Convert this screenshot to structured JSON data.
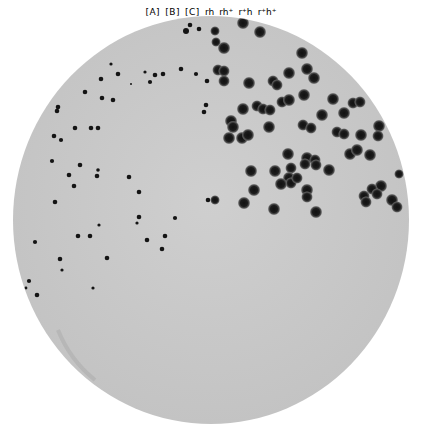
{
  "figure": {
    "colors": {
      "background": "#ffffff",
      "agar": "#c9c9c9",
      "rim": "#111111",
      "plaque": "#141414",
      "halo": "#5a5a5a"
    },
    "sections": [
      {
        "id": "A",
        "label": "[A]"
      },
      {
        "id": "B",
        "label": "[B]"
      },
      {
        "id": "C",
        "label": "[C]"
      }
    ],
    "plaque_labels": [
      {
        "id": "rh",
        "text": "rh"
      },
      {
        "id": "rh_plus",
        "text": "rh⁺"
      },
      {
        "id": "r_plus_h",
        "text": "r⁺h"
      },
      {
        "id": "r_plus_h_plus",
        "text": "r⁺h⁺"
      }
    ]
  }
}
